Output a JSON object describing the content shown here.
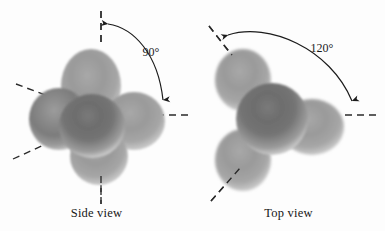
{
  "figure": {
    "background_color": "#fdfdfd",
    "ink_color": "#1b1b1b"
  },
  "panels": [
    {
      "id": "side-view",
      "caption": "Side view",
      "angle_label": "90°",
      "angle_degrees": 90,
      "sphere_count": 5,
      "description": "Space-filling model viewed from the side showing a 90 degree bond angle between the axial and equatorial reference axes",
      "reference_axes": [
        {
          "name": "axial-up",
          "style": "dashed",
          "direction": "up"
        },
        {
          "name": "axial-down",
          "style": "dashed",
          "direction": "down"
        },
        {
          "name": "equatorial-right",
          "style": "dashed",
          "direction": "right"
        },
        {
          "name": "equatorial-upper-left",
          "style": "dashed",
          "direction": "upper-left"
        },
        {
          "name": "equatorial-lower-left",
          "style": "dashed",
          "direction": "lower-left"
        }
      ]
    },
    {
      "id": "top-view",
      "caption": "Top view",
      "angle_label": "120°",
      "angle_degrees": 120,
      "sphere_count": 4,
      "description": "Space-filling model viewed from the top showing a 120 degree bond angle between equatorial reference axes",
      "reference_axes": [
        {
          "name": "equatorial-upper-left",
          "style": "dashed",
          "direction": "upper-left"
        },
        {
          "name": "equatorial-right",
          "style": "dashed",
          "direction": "right"
        },
        {
          "name": "equatorial-lower-left",
          "style": "dashed",
          "direction": "lower-left"
        }
      ]
    }
  ],
  "colors": {
    "sphere_light": "#f4f4f4",
    "sphere_mid": "#b9b9b9",
    "sphere_dark": "#6e6e6e",
    "sphere_core": "#565656",
    "rim": "#fbfbfb",
    "dash": "#2a2a2a",
    "arc": "#1b1b1b"
  }
}
